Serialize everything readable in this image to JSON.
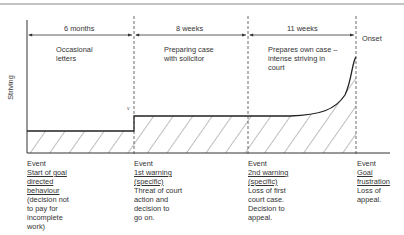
{
  "diagram": {
    "y_axis_label": "Striving",
    "periods": [
      {
        "duration": "6 months",
        "description_lines": [
          "Occasional",
          "letters"
        ]
      },
      {
        "duration": "8 weeks",
        "description_lines": [
          "Preparing case",
          "with solicitor"
        ]
      },
      {
        "duration": "11 weeks",
        "description_lines": [
          "Prepares own case –",
          "intense striving in",
          "court"
        ]
      }
    ],
    "onset_label": "Onset",
    "events": [
      {
        "heading": "Event",
        "title_lines": [
          "Start of goal",
          "directed",
          "behaviour"
        ],
        "detail_lines": [
          "(decision not",
          "to pay for",
          "incomplete",
          "work)"
        ]
      },
      {
        "heading": "Event",
        "title_lines": [
          "1st warning",
          "(specific)"
        ],
        "detail_lines": [
          "Threat of court",
          "action and",
          "decision to",
          "go on."
        ]
      },
      {
        "heading": "Event",
        "title_lines": [
          "2nd warning",
          "(specific)"
        ],
        "detail_lines": [
          "Loss of first",
          "court case.",
          "Decision to",
          "appeal."
        ]
      },
      {
        "heading": "Event",
        "title_lines": [
          "Goal",
          "frustration"
        ],
        "detail_lines": [
          "Loss of",
          "appeal."
        ]
      }
    ]
  }
}
